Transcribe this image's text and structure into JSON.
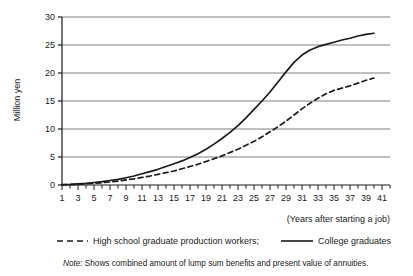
{
  "chart_data": {
    "type": "line",
    "title": "",
    "xlabel": "(Years after starting a job)",
    "ylabel": "Million yen",
    "xlim": [
      1,
      42
    ],
    "ylim": [
      0,
      30
    ],
    "yticks": [
      0,
      5,
      10,
      15,
      20,
      25,
      30
    ],
    "xticks": [
      1,
      3,
      5,
      7,
      9,
      11,
      13,
      15,
      17,
      19,
      21,
      23,
      25,
      27,
      29,
      31,
      33,
      35,
      37,
      39,
      41
    ],
    "xticks_minor_step": 1,
    "grid": "horizontal",
    "legend_position": "below",
    "note": "Shows combined amount of lump sum benefits and present value of annuities.",
    "note_prefix": "Note",
    "x": [
      1,
      2,
      3,
      4,
      5,
      6,
      7,
      8,
      9,
      10,
      11,
      12,
      13,
      14,
      15,
      16,
      17,
      18,
      19,
      20,
      21,
      22,
      23,
      24,
      25,
      26,
      27,
      28,
      29,
      30,
      31,
      32,
      33,
      34,
      35,
      36,
      37,
      38,
      39,
      40
    ],
    "series": [
      {
        "name": "College graduates",
        "style": "solid",
        "color": "#1a1a1a",
        "values": [
          0.05,
          0.1,
          0.2,
          0.3,
          0.45,
          0.6,
          0.8,
          1.0,
          1.3,
          1.6,
          2.0,
          2.4,
          2.8,
          3.3,
          3.8,
          4.3,
          4.9,
          5.6,
          6.4,
          7.3,
          8.3,
          9.4,
          10.6,
          12.0,
          13.5,
          15.0,
          16.6,
          18.4,
          20.2,
          21.9,
          23.2,
          24.1,
          24.7,
          25.1,
          25.5,
          25.9,
          26.2,
          26.6,
          26.9,
          27.1
        ]
      },
      {
        "name": "High school graduate production workers;",
        "style": "dashed",
        "color": "#1a1a1a",
        "values": [
          0.03,
          0.06,
          0.12,
          0.2,
          0.3,
          0.4,
          0.55,
          0.7,
          0.9,
          1.1,
          1.35,
          1.6,
          1.9,
          2.2,
          2.5,
          2.9,
          3.3,
          3.7,
          4.2,
          4.7,
          5.2,
          5.8,
          6.4,
          7.1,
          7.8,
          8.6,
          9.5,
          10.4,
          11.4,
          12.5,
          13.6,
          14.6,
          15.5,
          16.3,
          16.9,
          17.3,
          17.7,
          18.2,
          18.7,
          19.1
        ]
      }
    ]
  },
  "legend": {
    "items": [
      {
        "label": "High school graduate production workers;",
        "style": "dashed"
      },
      {
        "label": "College graduates",
        "style": "solid"
      }
    ]
  },
  "axis": {
    "x_caption": "(Years after starting a job)",
    "y_title": "Million yen"
  },
  "note": {
    "prefix": "Note",
    "separator": ":",
    "body": "Shows combined amount of lump sum benefits and present value of annuities."
  },
  "colors": {
    "line": "#1a1a1a",
    "grid": "#808080",
    "axis": "#1a1a1a",
    "background": "#ffffff"
  }
}
